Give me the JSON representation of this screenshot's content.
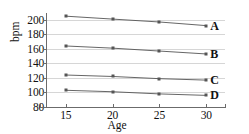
{
  "chart_data": {
    "type": "line",
    "title": "",
    "xlabel": "Age",
    "ylabel": "bpm",
    "x": [
      15,
      20,
      25,
      30
    ],
    "xlim": [
      13,
      32
    ],
    "ylim": [
      80,
      208
    ],
    "xticks": [
      "15",
      "20",
      "25",
      "30"
    ],
    "yticks": [
      "80",
      "100",
      "120",
      "140",
      "160",
      "180",
      "200"
    ],
    "grid": true,
    "legend_position": "right-inline",
    "series": [
      {
        "name": "A",
        "label": "A",
        "values": [
          205,
          201,
          197,
          192
        ],
        "color": "#555555"
      },
      {
        "name": "B",
        "label": "B",
        "values": [
          164,
          161,
          157,
          153
        ],
        "color": "#555555"
      },
      {
        "name": "C",
        "label": "C",
        "values": [
          124,
          122,
          119,
          117
        ],
        "color": "#555555"
      },
      {
        "name": "D",
        "label": "D",
        "values": [
          103,
          101,
          98,
          96
        ],
        "color": "#555555"
      }
    ]
  },
  "style": {
    "background": "#ffffff",
    "grid_color": "#d6d6d6",
    "axis_color": "#6b6b6b",
    "text_color": "#111111"
  }
}
